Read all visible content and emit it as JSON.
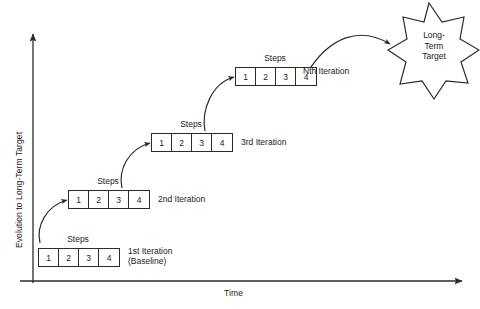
{
  "diagram": {
    "axes": {
      "y_label": "Evolution to Long-Term Target",
      "x_label": "Time"
    },
    "steps_label": "Steps",
    "target": {
      "line1": "Long-",
      "line2": "Term",
      "line3": "Target"
    },
    "iterations": [
      {
        "id": "iteration-1",
        "label": "1st Iteration",
        "sublabel": "(Baseline)",
        "steps_label": "Steps",
        "steps": [
          "1",
          "2",
          "3",
          "4"
        ]
      },
      {
        "id": "iteration-2",
        "label": "2nd Iteration",
        "sublabel": "",
        "steps_label": "Steps",
        "steps": [
          "1",
          "2",
          "3",
          "4"
        ]
      },
      {
        "id": "iteration-3",
        "label": "3rd Iteration",
        "sublabel": "",
        "steps_label": "Steps",
        "steps": [
          "1",
          "2",
          "3",
          "4"
        ]
      },
      {
        "id": "iteration-n",
        "label": "Nth Iteration",
        "sublabel": "",
        "steps_label": "Steps",
        "steps": [
          "1",
          "2",
          "3",
          "4"
        ]
      }
    ],
    "colors": {
      "stroke": "#2b2b2b",
      "text": "#1a1a1a",
      "background": "#ffffff"
    }
  }
}
